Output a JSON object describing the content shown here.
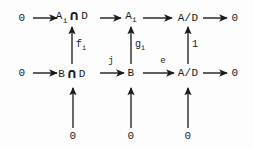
{
  "diagram": {
    "background": "#fdfdfd",
    "ink": "#1a1a1a",
    "intersection_symbol": "∩",
    "rows": {
      "top": {
        "nodes": [
          {
            "id": "t0",
            "text": "0",
            "x": 22,
            "y": 18
          },
          {
            "id": "t1",
            "pre": "A",
            "sub": "i",
            "post": "D",
            "x": 72,
            "y": 18
          },
          {
            "id": "t2",
            "pre": "A",
            "sub": "i",
            "post": "",
            "x": 131,
            "y": 18
          },
          {
            "id": "t3",
            "text": "A/D",
            "x": 188,
            "y": 18
          },
          {
            "id": "t4",
            "text": "0",
            "x": 235,
            "y": 18
          }
        ]
      },
      "bottom": {
        "nodes": [
          {
            "id": "b0",
            "text": "0",
            "x": 22,
            "y": 73
          },
          {
            "id": "b1",
            "pre": "B",
            "sub": "",
            "post": "D",
            "x": 72,
            "y": 73
          },
          {
            "id": "b2",
            "text": "B",
            "x": 131,
            "y": 73
          },
          {
            "id": "b3",
            "text": "A/D",
            "x": 188,
            "y": 73
          },
          {
            "id": "b4",
            "text": "0",
            "x": 235,
            "y": 73
          }
        ]
      },
      "base": {
        "nodes": [
          {
            "id": "z0",
            "text": "0",
            "x": 73,
            "y": 136
          },
          {
            "id": "z1",
            "text": "0",
            "x": 131,
            "y": 136
          },
          {
            "id": "z2",
            "text": "0",
            "x": 188,
            "y": 136
          }
        ]
      }
    },
    "horizontal_labels": [
      {
        "id": "j",
        "text": "j",
        "x": 111,
        "y": 66
      },
      {
        "id": "e",
        "text": "e",
        "x": 163,
        "y": 66
      }
    ],
    "vertical_labels": [
      {
        "id": "f",
        "base": "f",
        "sub": "i",
        "x": 76,
        "y": 46
      },
      {
        "id": "g",
        "base": "g",
        "sub": "i",
        "x": 135,
        "y": 46
      },
      {
        "id": "one",
        "base": "1",
        "sub": "",
        "x": 192,
        "y": 46
      }
    ],
    "horizontal_arrows": [
      {
        "id": "top-0-to-AiD",
        "x1": 33,
        "y1": 18,
        "x2": 57,
        "y2": 18
      },
      {
        "id": "top-AiD-to-Ai",
        "x1": 100,
        "y1": 18,
        "x2": 121,
        "y2": 18
      },
      {
        "id": "top-Ai-to-AD",
        "x1": 143,
        "y1": 18,
        "x2": 172,
        "y2": 18
      },
      {
        "id": "top-AD-to-0",
        "x1": 203,
        "y1": 18,
        "x2": 227,
        "y2": 18
      },
      {
        "id": "bottom-0-to-BD",
        "x1": 33,
        "y1": 73,
        "x2": 57,
        "y2": 73
      },
      {
        "id": "bottom-BD-to-B",
        "x1": 100,
        "y1": 73,
        "x2": 124,
        "y2": 73
      },
      {
        "id": "bottom-B-to-AD",
        "x1": 143,
        "y1": 73,
        "x2": 174,
        "y2": 73
      },
      {
        "id": "bottom-AD-to-0",
        "x1": 203,
        "y1": 73,
        "x2": 227,
        "y2": 73
      }
    ],
    "vertical_arrows": [
      {
        "id": "f-arrow",
        "x1": 72,
        "y1": 64,
        "x2": 72,
        "y2": 27
      },
      {
        "id": "g-arrow",
        "x1": 131,
        "y1": 64,
        "x2": 131,
        "y2": 27
      },
      {
        "id": "one-arrow",
        "x1": 188,
        "y1": 64,
        "x2": 188,
        "y2": 27
      },
      {
        "id": "zero1-arrow",
        "x1": 73,
        "y1": 128,
        "x2": 73,
        "y2": 88
      },
      {
        "id": "zero2-arrow",
        "x1": 131,
        "y1": 128,
        "x2": 131,
        "y2": 88
      },
      {
        "id": "zero3-arrow",
        "x1": 188,
        "y1": 128,
        "x2": 188,
        "y2": 88
      }
    ]
  }
}
